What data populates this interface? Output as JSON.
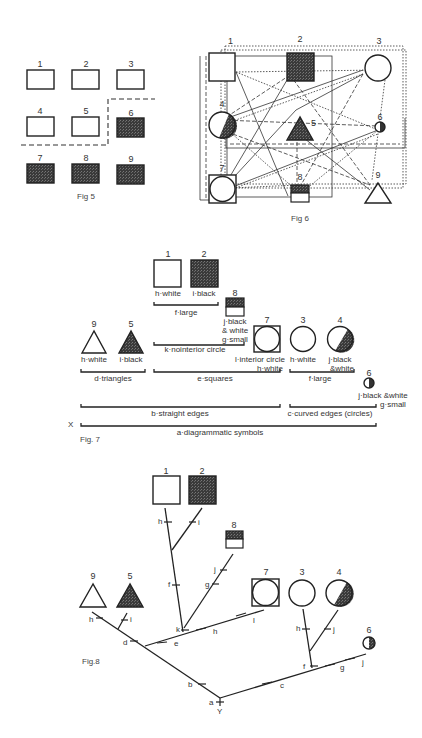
{
  "colors": {
    "ink": "#222222",
    "black_fill": "#3a3a3a",
    "white_fill": "#ffffff"
  },
  "fig5": {
    "caption": "Fig 5",
    "boxes": [
      {
        "n": "1",
        "fill": "white"
      },
      {
        "n": "2",
        "fill": "white"
      },
      {
        "n": "3",
        "fill": "white"
      },
      {
        "n": "4",
        "fill": "white"
      },
      {
        "n": "5",
        "fill": "white"
      },
      {
        "n": "6",
        "fill": "black"
      },
      {
        "n": "7",
        "fill": "black"
      },
      {
        "n": "8",
        "fill": "black"
      },
      {
        "n": "9",
        "fill": "black"
      }
    ]
  },
  "fig6": {
    "caption": "Fig 6",
    "nodes": [
      {
        "n": "1",
        "shape": "square",
        "fill": "white"
      },
      {
        "n": "2",
        "shape": "square",
        "fill": "black"
      },
      {
        "n": "3",
        "shape": "circle",
        "fill": "white"
      },
      {
        "n": "4",
        "shape": "circle",
        "fill": "half"
      },
      {
        "n": "5",
        "shape": "triangle",
        "fill": "black"
      },
      {
        "n": "6",
        "shape": "small-circle",
        "fill": "half"
      },
      {
        "n": "7",
        "shape": "square-circle",
        "fill": "white"
      },
      {
        "n": "8",
        "shape": "small-square",
        "fill": "half"
      },
      {
        "n": "9",
        "shape": "triangle",
        "fill": "white"
      }
    ]
  },
  "fig7": {
    "caption": "Fig. 7",
    "x_mark": "X",
    "items": [
      {
        "n": "1",
        "label": "h·white"
      },
      {
        "n": "2",
        "label": "i·black"
      },
      {
        "n": "8",
        "label_lines": [
          "j·black",
          "& white",
          "g·small"
        ]
      },
      {
        "n": "9",
        "label": "h·white"
      },
      {
        "n": "5",
        "label": "i·black"
      },
      {
        "n": "7",
        "label_lines": [
          "l·interior circle",
          "h·white"
        ]
      },
      {
        "n": "3",
        "label": "h·white"
      },
      {
        "n": "4",
        "label_lines": [
          "j·black",
          "&white"
        ]
      },
      {
        "n": "6",
        "label_lines": [
          "j·black &white",
          "g·small"
        ]
      }
    ],
    "brackets": {
      "f_large_sq": "f·large",
      "k": "k·nointerior circle",
      "d": "d·triangles",
      "e": "e·squares",
      "f_large_c": "f·large",
      "b": "b·straight edges",
      "c": "c·curved edges (circles)",
      "a": "a·diagrammatic symbols"
    }
  },
  "fig8": {
    "caption": "Fig.8",
    "nums": {
      "n1": "1",
      "n2": "2",
      "n8": "8",
      "n9": "9",
      "n5": "5",
      "n7": "7",
      "n3": "3",
      "n4": "4",
      "n6": "6"
    },
    "edge_labels": {
      "h1": "h",
      "i2": "i",
      "j8": "j",
      "g8": "g",
      "f": "f",
      "h9": "h",
      "i5": "i",
      "d": "d",
      "e": "e",
      "k": "k",
      "h7": "h",
      "l": "l",
      "b": "b",
      "c": "c",
      "a": "a",
      "Y": "Y",
      "h3": "h",
      "j4": "j",
      "f2": "f",
      "g6": "g",
      "j6": "j"
    }
  }
}
